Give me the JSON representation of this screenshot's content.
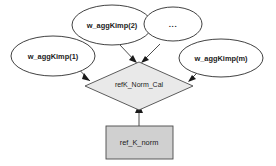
{
  "diagram": {
    "colors": {
      "ellipse_fill": "#ffffff",
      "diamond_fill": "#e9e9e9",
      "rect_fill": "#d0d0d0",
      "stroke": "#3a3a3a",
      "text": "#1a1a1a",
      "background": "#ffffff"
    },
    "nodes": {
      "input_1": {
        "label": "w_aggKimp(1)",
        "shape": "ellipse"
      },
      "input_2": {
        "label": "w_aggKimp(2)",
        "shape": "ellipse"
      },
      "input_ellipsis": {
        "label": "...",
        "shape": "ellipse"
      },
      "input_m": {
        "label": "w_aggKimp(m)",
        "shape": "ellipse"
      },
      "process": {
        "label": "refK_Norm_Cal",
        "shape": "diamond"
      },
      "output": {
        "label": "ref_K_norm",
        "shape": "rectangle"
      }
    },
    "edges": [
      {
        "from": "w_aggKimp(1)",
        "to": "refK_Norm_Cal",
        "arrow": "to-target"
      },
      {
        "from": "w_aggKimp(2)",
        "to": "refK_Norm_Cal",
        "arrow": "to-target"
      },
      {
        "from": "...",
        "to": "refK_Norm_Cal",
        "arrow": "to-target"
      },
      {
        "from": "w_aggKimp(m)",
        "to": "refK_Norm_Cal",
        "arrow": "to-target"
      },
      {
        "from": "ref_K_norm",
        "to": "refK_Norm_Cal",
        "arrow": "to-target"
      }
    ]
  }
}
